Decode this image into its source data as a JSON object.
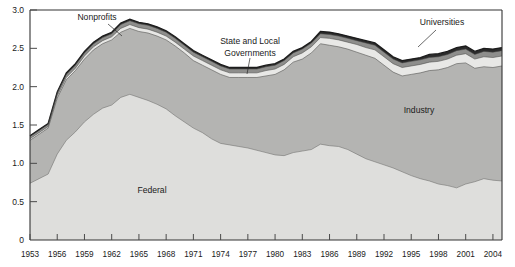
{
  "chart_data": {
    "type": "area",
    "title": "",
    "subtitle": "",
    "xlabel": "",
    "ylabel": "",
    "stacked": true,
    "grid": false,
    "legend_position": "inline-annotations",
    "xlim": [
      1953,
      2005
    ],
    "ylim": [
      0,
      3.0
    ],
    "yticks": [
      "0",
      "0.5",
      "1.0",
      "1.5",
      "2.0",
      "2.5",
      "3.0"
    ],
    "ytick_values": [
      0,
      0.5,
      1.0,
      1.5,
      2.0,
      2.5,
      3.0
    ],
    "xticks": [
      "1953",
      "1956",
      "1959",
      "1962",
      "1965",
      "1968",
      "1971",
      "1974",
      "1977",
      "1980",
      "1983",
      "1986",
      "1989",
      "1992",
      "1995",
      "1998",
      "2001",
      "2004"
    ],
    "xtick_values": [
      1953,
      1956,
      1959,
      1962,
      1965,
      1968,
      1971,
      1974,
      1977,
      1980,
      1983,
      1986,
      1989,
      1992,
      1995,
      1998,
      2001,
      2004
    ],
    "x": [
      1953,
      1954,
      1955,
      1956,
      1957,
      1958,
      1959,
      1960,
      1961,
      1962,
      1963,
      1964,
      1965,
      1966,
      1967,
      1968,
      1969,
      1970,
      1971,
      1972,
      1973,
      1974,
      1975,
      1976,
      1977,
      1978,
      1979,
      1980,
      1981,
      1982,
      1983,
      1984,
      1985,
      1986,
      1987,
      1988,
      1989,
      1990,
      1991,
      1992,
      1993,
      1994,
      1995,
      1996,
      1997,
      1998,
      1999,
      2000,
      2001,
      2002,
      2003,
      2004,
      2005
    ],
    "series": [
      {
        "name": "Federal",
        "color": "#dededc",
        "values": [
          0.74,
          0.8,
          0.86,
          1.12,
          1.3,
          1.41,
          1.54,
          1.64,
          1.72,
          1.76,
          1.86,
          1.9,
          1.86,
          1.82,
          1.77,
          1.71,
          1.62,
          1.54,
          1.46,
          1.4,
          1.32,
          1.26,
          1.24,
          1.22,
          1.2,
          1.17,
          1.14,
          1.11,
          1.1,
          1.14,
          1.16,
          1.18,
          1.25,
          1.23,
          1.22,
          1.18,
          1.12,
          1.06,
          1.02,
          0.98,
          0.94,
          0.89,
          0.84,
          0.8,
          0.77,
          0.73,
          0.71,
          0.68,
          0.73,
          0.76,
          0.8,
          0.78,
          0.77
        ]
      },
      {
        "name": "Industry",
        "color": "#b4b4b2",
        "values": [
          0.56,
          0.58,
          0.6,
          0.73,
          0.79,
          0.8,
          0.82,
          0.84,
          0.84,
          0.85,
          0.85,
          0.86,
          0.86,
          0.88,
          0.89,
          0.9,
          0.91,
          0.9,
          0.88,
          0.88,
          0.9,
          0.9,
          0.88,
          0.9,
          0.92,
          0.95,
          1.0,
          1.05,
          1.12,
          1.18,
          1.2,
          1.26,
          1.31,
          1.31,
          1.3,
          1.31,
          1.33,
          1.35,
          1.35,
          1.3,
          1.25,
          1.25,
          1.32,
          1.38,
          1.44,
          1.49,
          1.54,
          1.62,
          1.58,
          1.48,
          1.46,
          1.47,
          1.5
        ]
      },
      {
        "name": "Universities",
        "color": "#e8e8e6",
        "values": [
          0.02,
          0.02,
          0.02,
          0.03,
          0.03,
          0.03,
          0.04,
          0.04,
          0.04,
          0.04,
          0.05,
          0.05,
          0.05,
          0.05,
          0.05,
          0.05,
          0.05,
          0.05,
          0.06,
          0.06,
          0.06,
          0.06,
          0.06,
          0.06,
          0.06,
          0.06,
          0.07,
          0.07,
          0.07,
          0.07,
          0.08,
          0.08,
          0.08,
          0.09,
          0.09,
          0.09,
          0.1,
          0.1,
          0.11,
          0.11,
          0.11,
          0.11,
          0.11,
          0.11,
          0.11,
          0.11,
          0.11,
          0.11,
          0.12,
          0.12,
          0.13,
          0.13,
          0.13
        ]
      },
      {
        "name": "Nonprofits",
        "color": "#8e8e8c",
        "values": [
          0.03,
          0.03,
          0.03,
          0.04,
          0.04,
          0.04,
          0.04,
          0.04,
          0.04,
          0.04,
          0.05,
          0.05,
          0.05,
          0.05,
          0.05,
          0.05,
          0.05,
          0.05,
          0.05,
          0.05,
          0.05,
          0.05,
          0.05,
          0.05,
          0.05,
          0.05,
          0.05,
          0.05,
          0.05,
          0.05,
          0.05,
          0.05,
          0.05,
          0.05,
          0.05,
          0.05,
          0.05,
          0.06,
          0.06,
          0.06,
          0.06,
          0.06,
          0.06,
          0.06,
          0.06,
          0.06,
          0.06,
          0.06,
          0.06,
          0.06,
          0.07,
          0.07,
          0.07
        ]
      },
      {
        "name": "State and Local Governments",
        "color": "#2b2b2b",
        "values": [
          0.01,
          0.01,
          0.01,
          0.01,
          0.02,
          0.02,
          0.02,
          0.02,
          0.02,
          0.02,
          0.02,
          0.02,
          0.02,
          0.02,
          0.02,
          0.02,
          0.02,
          0.02,
          0.02,
          0.02,
          0.02,
          0.02,
          0.02,
          0.02,
          0.02,
          0.02,
          0.02,
          0.02,
          0.02,
          0.02,
          0.02,
          0.02,
          0.03,
          0.03,
          0.03,
          0.03,
          0.03,
          0.03,
          0.03,
          0.03,
          0.03,
          0.03,
          0.03,
          0.03,
          0.04,
          0.04,
          0.04,
          0.04,
          0.04,
          0.04,
          0.04,
          0.04,
          0.04
        ]
      }
    ],
    "annotations": [
      {
        "name": "nonprofits",
        "text": "Nonprofits",
        "x": 97,
        "y": 20,
        "leader": [
          [
            108,
            24
          ],
          [
            122,
            36
          ]
        ]
      },
      {
        "name": "state-and-local-governments",
        "text": "State and Local",
        "x": 250,
        "y": 44,
        "leader": [
          [
            250,
            58
          ],
          [
            247,
            74
          ]
        ]
      },
      {
        "name": "state-and-local-governments-line2",
        "text": "Governments",
        "x": 250,
        "y": 56,
        "leader": null
      },
      {
        "name": "universities",
        "text": "Universities",
        "x": 442,
        "y": 25,
        "leader": [
          [
            436,
            30
          ],
          [
            418,
            47
          ]
        ]
      },
      {
        "name": "industry",
        "text": "Industry",
        "x": 419,
        "y": 113,
        "leader": null
      },
      {
        "name": "federal",
        "text": "Federal",
        "x": 152,
        "y": 193,
        "leader": null
      }
    ]
  },
  "colors": {
    "federal": "#dededc",
    "industry": "#b4b4b2",
    "universities": "#e8e8e6",
    "nonprofits": "#8e8e8c",
    "state_local": "#2b2b2b",
    "axis": "#333333",
    "text": "#1a1a1a",
    "background": "#ffffff"
  }
}
